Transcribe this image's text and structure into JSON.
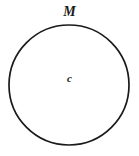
{
  "figure": {
    "type": "geometry-diagram",
    "width": 139,
    "height": 156,
    "background_color": "#ffffff",
    "stroke_color": "#1a1a1a",
    "stroke_width": 1.7,
    "fill": "none",
    "circle": {
      "center_x": 69,
      "center_y": 85,
      "radius": 60
    },
    "labels": {
      "arc_label": "M",
      "center_label": "c"
    }
  },
  "chart_data": {
    "type": "scatter",
    "title": "",
    "xlabel": "",
    "ylabel": "",
    "grid": false,
    "legend": "none",
    "shapes": [
      {
        "kind": "circle",
        "cx": 69,
        "cy": 85,
        "r": 60,
        "stroke": "#1a1a1a",
        "fill": "none",
        "label": "M"
      }
    ],
    "annotations": [
      {
        "text": "M",
        "x": 72,
        "y": 14,
        "style": "italic"
      },
      {
        "text": "c",
        "x": 71,
        "y": 80,
        "style": "italic"
      }
    ]
  }
}
